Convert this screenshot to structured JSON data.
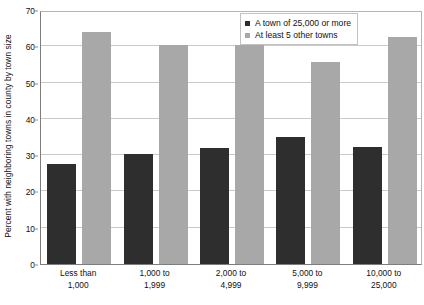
{
  "chart_data": {
    "type": "bar",
    "title": "",
    "subtitle": "",
    "xlabel": "",
    "ylabel": "Percent with neighboring towns in county by town size",
    "ylim": [
      0,
      70
    ],
    "ytick_step": 10,
    "yticks": [
      0,
      10,
      20,
      30,
      40,
      50,
      60,
      70
    ],
    "grid": true,
    "legend_position": "top-right",
    "categories": [
      "Less than 1,000",
      "1,000 to 1,999",
      "2,000 to 4,999",
      "5,000 to 9,999",
      "10,000 to 25,000"
    ],
    "categories_lines": [
      [
        "Less than",
        "1,000"
      ],
      [
        "1,000 to",
        "1,999"
      ],
      [
        "2,000 to",
        "4,999"
      ],
      [
        "5,000 to",
        "9,999"
      ],
      [
        "10,000 to",
        "25,000"
      ]
    ],
    "series": [
      {
        "name": "A town of 25,000 or more",
        "color": "#2e2e2e",
        "values": [
          27.5,
          30.2,
          32.0,
          35.0,
          32.3
        ]
      },
      {
        "name": "At least 5 other towns",
        "color": "#a8a8a8",
        "values": [
          64.0,
          60.3,
          60.3,
          55.7,
          62.7
        ]
      }
    ]
  },
  "legend": {
    "items": [
      {
        "label": "A town of 25,000 or more",
        "swatch": "dark-square-icon"
      },
      {
        "label": "At least 5 other towns",
        "swatch": "gray-square-icon"
      }
    ]
  },
  "axes": {
    "y_title": "Percent with neighboring towns in county by town size",
    "y_tick_labels": [
      "70",
      "60",
      "50",
      "40",
      "30",
      "20",
      "10",
      "0"
    ]
  },
  "colors": {
    "series_dark": "#2e2e2e",
    "series_gray": "#a8a8a8",
    "gridline": "#c9c9c9",
    "axis": "#7d7d7d",
    "background": "#ffffff"
  }
}
